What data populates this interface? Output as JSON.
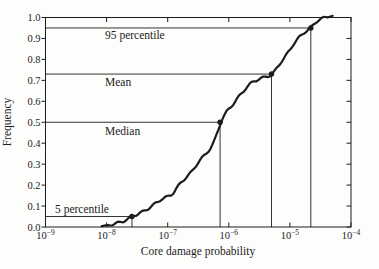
{
  "chart_data": {
    "type": "line",
    "title": "",
    "xlabel": "Core damage probability",
    "ylabel": "Frequency",
    "x_scale": "log",
    "xlim": [
      1e-09,
      0.0001
    ],
    "ylim": [
      0.0,
      1.0
    ],
    "x_tick_exponents": [
      -9,
      -8,
      -7,
      -6,
      -5,
      -4
    ],
    "y_ticks": [
      0.0,
      0.1,
      0.2,
      0.3,
      0.4,
      0.5,
      0.6,
      0.7,
      0.8,
      0.9,
      1.0
    ],
    "grid": false,
    "legend": null,
    "curve": {
      "name": "cumulative-distribution",
      "points_log10x_y": [
        [
          -8.08,
          0.004
        ],
        [
          -7.94,
          0.01
        ],
        [
          -7.81,
          0.02
        ],
        [
          -7.69,
          0.032
        ],
        [
          -7.585,
          0.05
        ],
        [
          -7.45,
          0.067
        ],
        [
          -7.28,
          0.095
        ],
        [
          -7.15,
          0.124
        ],
        [
          -7.02,
          0.143
        ],
        [
          -6.91,
          0.162
        ],
        [
          -6.79,
          0.21
        ],
        [
          -6.63,
          0.257
        ],
        [
          -6.47,
          0.319
        ],
        [
          -6.3,
          0.376
        ],
        [
          -6.22,
          0.424
        ],
        [
          -6.13,
          0.5
        ],
        [
          -6.04,
          0.548
        ],
        [
          -5.93,
          0.586
        ],
        [
          -5.83,
          0.624
        ],
        [
          -5.72,
          0.662
        ],
        [
          -5.62,
          0.69
        ],
        [
          -5.51,
          0.705
        ],
        [
          -5.4,
          0.717
        ],
        [
          -5.29,
          0.73
        ],
        [
          -5.16,
          0.781
        ],
        [
          -5.03,
          0.833
        ],
        [
          -4.92,
          0.881
        ],
        [
          -4.8,
          0.919
        ],
        [
          -4.665,
          0.95
        ],
        [
          -4.54,
          0.986
        ],
        [
          -4.42,
          1.0
        ],
        [
          -4.3,
          1.008
        ]
      ]
    },
    "annotations": [
      {
        "label": "95 percentile",
        "x": 2.2e-05,
        "y": 0.95
      },
      {
        "label": "Mean",
        "x": 5e-06,
        "y": 0.73
      },
      {
        "label": "Median",
        "x": 7.2e-07,
        "y": 0.5
      },
      {
        "label": "5 percentile",
        "x": 2.6e-08,
        "y": 0.05
      }
    ]
  },
  "colors": {
    "line": "#1c1c1c",
    "frame": "#1c1c1c",
    "background": "#fdfdfc"
  }
}
